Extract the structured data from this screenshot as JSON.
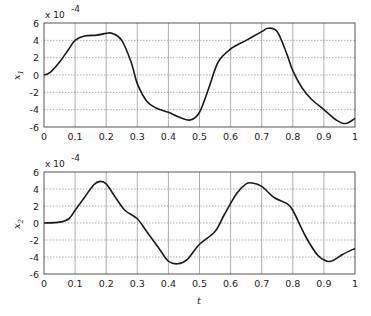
{
  "chart_data": [
    {
      "type": "line",
      "title": "",
      "xlabel": "",
      "ylabel": "x1",
      "ylabel_main": "x",
      "ylabel_sub": "1",
      "scale_label": "x 10",
      "scale_exp": "-4",
      "xlim": [
        0,
        1
      ],
      "ylim": [
        -6,
        6
      ],
      "grid": true,
      "xticks": [
        "0",
        "0.1",
        "0.2",
        "0.3",
        "0.4",
        "0.5",
        "0.6",
        "0.7",
        "0.8",
        "0.9",
        "1"
      ],
      "yticks": [
        "6",
        "4",
        "2",
        "0",
        "-2",
        "-4",
        "-6"
      ],
      "series": [
        {
          "name": "x1",
          "x": [
            0,
            0.02,
            0.05,
            0.08,
            0.1,
            0.13,
            0.17,
            0.2,
            0.22,
            0.25,
            0.28,
            0.3,
            0.33,
            0.36,
            0.4,
            0.43,
            0.47,
            0.5,
            0.53,
            0.56,
            0.6,
            0.65,
            0.7,
            0.72,
            0.75,
            0.78,
            0.8,
            0.83,
            0.86,
            0.9,
            0.94,
            0.97,
            1.0
          ],
          "values": [
            0,
            0.3,
            1.5,
            3.0,
            4.0,
            4.5,
            4.6,
            4.8,
            4.8,
            4.0,
            1.5,
            -1.0,
            -3.0,
            -3.8,
            -4.3,
            -4.8,
            -5.2,
            -4.3,
            -1.5,
            1.5,
            3.0,
            4.0,
            5.0,
            5.4,
            5.0,
            2.5,
            0.5,
            -1.5,
            -2.8,
            -4.0,
            -5.2,
            -5.6,
            -5.0
          ]
        }
      ]
    },
    {
      "type": "line",
      "title": "",
      "xlabel": "t",
      "ylabel": "x2",
      "ylabel_main": "x",
      "ylabel_sub": "2",
      "scale_label": "x 10",
      "scale_exp": "-4",
      "xlim": [
        0,
        1
      ],
      "ylim": [
        -6,
        6
      ],
      "grid": true,
      "xticks": [
        "0",
        "0.1",
        "0.2",
        "0.3",
        "0.4",
        "0.5",
        "0.6",
        "0.7",
        "0.8",
        "0.9",
        "1"
      ],
      "yticks": [
        "6",
        "4",
        "2",
        "0",
        "-2",
        "-4",
        "-6"
      ],
      "series": [
        {
          "name": "x2",
          "x": [
            0,
            0.05,
            0.08,
            0.1,
            0.13,
            0.16,
            0.18,
            0.2,
            0.23,
            0.26,
            0.3,
            0.33,
            0.37,
            0.4,
            0.43,
            0.46,
            0.5,
            0.55,
            0.58,
            0.62,
            0.65,
            0.67,
            0.7,
            0.74,
            0.78,
            0.8,
            0.84,
            0.88,
            0.91,
            0.93,
            0.96,
            1.0
          ],
          "values": [
            0,
            0.1,
            0.5,
            1.5,
            3.0,
            4.5,
            4.9,
            4.6,
            3.0,
            1.5,
            0.5,
            -1.0,
            -3.0,
            -4.5,
            -4.8,
            -4.3,
            -2.5,
            -1.0,
            1.0,
            3.5,
            4.6,
            4.7,
            4.3,
            3.0,
            2.3,
            1.5,
            -1.5,
            -3.8,
            -4.5,
            -4.4,
            -3.7,
            -3.0
          ]
        }
      ]
    }
  ],
  "xlabel_bottom": "t"
}
